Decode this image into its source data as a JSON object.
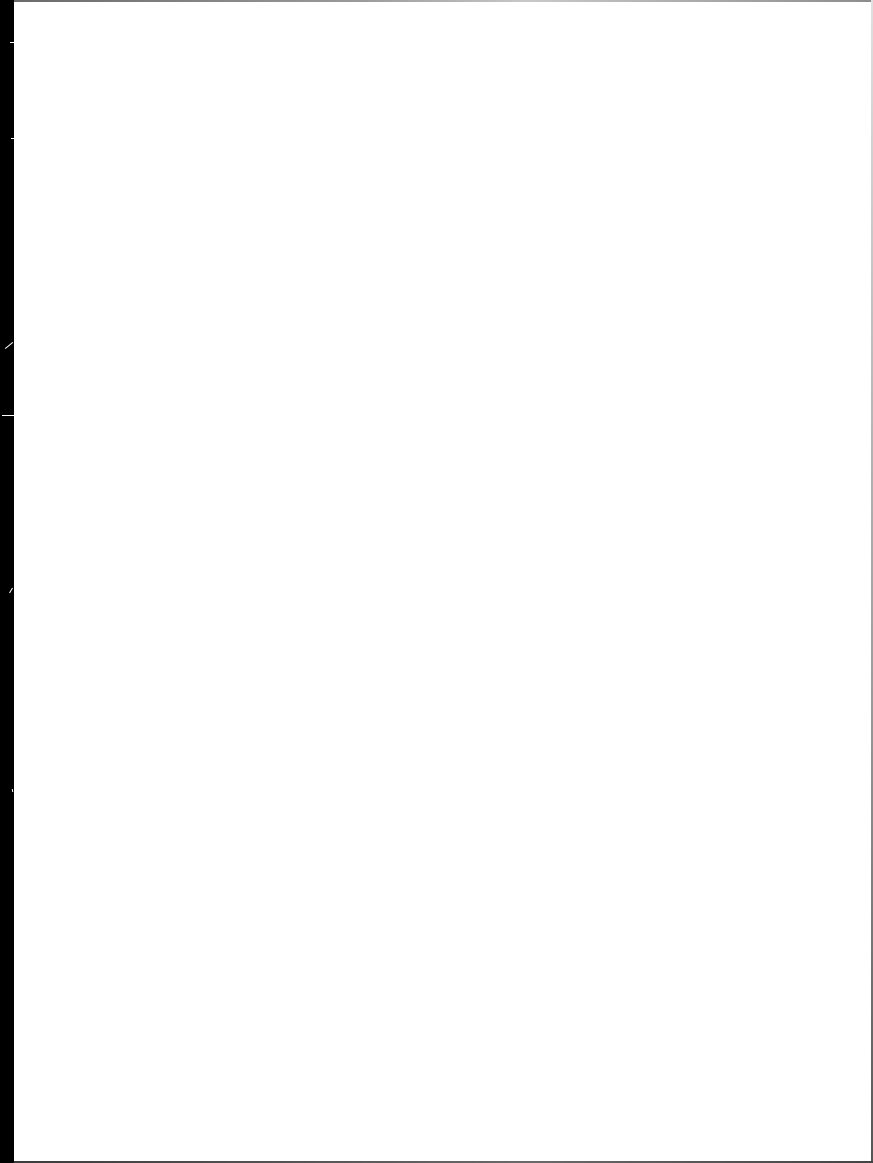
{
  "document": {
    "type": "scanned-page",
    "state": "blank",
    "content": [],
    "colors": {
      "page": "#ffffff",
      "scan_edge": "#000000",
      "border": "#8c8c8c"
    }
  }
}
